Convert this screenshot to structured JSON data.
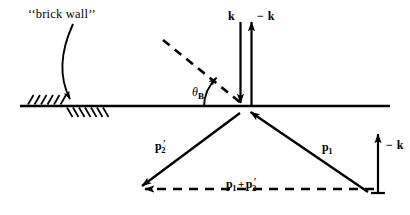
{
  "figure": {
    "background_color": "#ffffff",
    "stroke_color": "#000000",
    "width": 410,
    "height": 215
  },
  "annotations": {
    "wall_label": "‘‘brick wall’’",
    "theta_symbol": "θ",
    "theta_subscript": "B",
    "k_label": "k",
    "minus_k_top_label": "− k",
    "minus_k_right_label": "− k",
    "p1_label": "p",
    "p1_subscript": "1",
    "p2prime_label": "p",
    "p2prime_subscript": "2",
    "p2prime_prime": "′",
    "sum_p1": "p",
    "sum_p1_subscript": "1",
    "sum_plus": "+",
    "sum_p2": "p",
    "sum_p2_subscript": "2",
    "sum_p2_prime": "′"
  },
  "geometry": {
    "surface_line": {
      "x1": 20,
      "y1": 106,
      "x2": 390,
      "y2": 106
    },
    "origin": {
      "x": 245,
      "y": 107
    },
    "hatch_upper": {
      "x_start": 28,
      "x_end": 63,
      "count": 6,
      "side": "above"
    },
    "hatch_lower": {
      "x_start": 66,
      "x_end": 103,
      "count": 7,
      "side": "below"
    },
    "incident_dashed_ray": {
      "x1": 163,
      "y1": 40,
      "x2": 240,
      "y2": 102
    },
    "k_arrow_down": {
      "x1": 240,
      "y1": 22,
      "x2": 240,
      "y2": 104,
      "direction": "down"
    },
    "minus_k_arrow_up": {
      "x1": 252,
      "y1": 106,
      "x2": 252,
      "y2": 22,
      "direction": "up"
    },
    "minus_k_right_arrow_up": {
      "x1": 378,
      "y1": 193,
      "x2": 378,
      "y2": 134,
      "direction": "up"
    },
    "p1_arrow": {
      "x1": 367,
      "y1": 192,
      "x2": 250,
      "y2": 112,
      "direction": "toward-origin"
    },
    "p2prime_arrow": {
      "x1": 240,
      "y1": 113,
      "x2": 140,
      "y2": 188,
      "direction": "away-from-origin"
    },
    "sum_dashed_arrow": {
      "x1": 374,
      "y1": 189,
      "x2": 141,
      "y2": 189,
      "direction": "left"
    },
    "angle_arc": {
      "center_x": 245,
      "center_y": 107,
      "radius": 41,
      "from_deg": 180,
      "to_deg": 220
    },
    "wall_leader_curve": {
      "x1": 73,
      "y1": 24,
      "cx": 58,
      "cy": 62,
      "x2": 70,
      "y2": 101
    }
  },
  "label_positions": {
    "wall_label": {
      "x": 28,
      "y": 8
    },
    "theta": {
      "x": 192,
      "y": 87
    },
    "k": {
      "x": 228,
      "y": 10
    },
    "minus_k_top": {
      "x": 258,
      "y": 10
    },
    "minus_k_right": {
      "x": 385,
      "y": 139
    },
    "p1": {
      "x": 322,
      "y": 142
    },
    "p2prime": {
      "x": 155,
      "y": 140
    },
    "sum": {
      "x": 226,
      "y": 178
    }
  }
}
